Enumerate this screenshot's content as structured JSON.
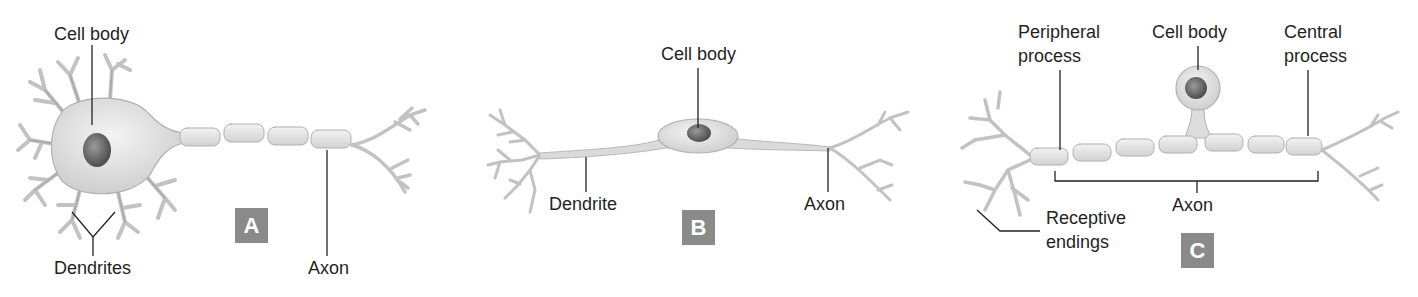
{
  "panels": {
    "A": {
      "badge": "A",
      "labels": {
        "cell_body": "Cell body",
        "dendrites": "Dendrites",
        "axon": "Axon"
      }
    },
    "B": {
      "badge": "B",
      "labels": {
        "cell_body": "Cell body",
        "dendrite": "Dendrite",
        "axon": "Axon"
      }
    },
    "C": {
      "badge": "C",
      "labels": {
        "peripheral_1": "Peripheral",
        "peripheral_2": "process",
        "cell_body": "Cell body",
        "central_1": "Central",
        "central_2": "process",
        "axon": "Axon",
        "receptive_1": "Receptive",
        "receptive_2": "endings"
      }
    }
  },
  "colors": {
    "badge_bg": "#8a8a8a",
    "cell_fill": "#e4e4e4",
    "cell_stroke": "#b5b5b5",
    "nucleus": "#6a6a6a",
    "leader": "#222222"
  }
}
